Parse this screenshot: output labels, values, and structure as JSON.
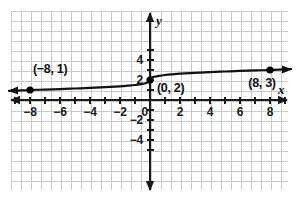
{
  "chart_data": {
    "type": "line",
    "title": "",
    "xlabel": "x",
    "ylabel": "y",
    "grid": true,
    "legend": false,
    "xlim": [
      -9.5,
      9.5
    ],
    "ylim": [
      -5.8,
      5.5
    ],
    "xticks": [
      -8,
      -6,
      -4,
      -2,
      0,
      2,
      4,
      6,
      8
    ],
    "yticks": [
      4,
      2,
      -2,
      -4
    ],
    "xtick_labels": [
      "−8",
      "−6",
      "−4",
      "−2",
      "0",
      "2",
      "4",
      "6",
      "8"
    ],
    "ytick_labels": [
      "4",
      "2",
      "−2",
      "−4"
    ],
    "minor_tick_step": 1,
    "curve_description": "cube root function shifted up 2 units",
    "series": [
      {
        "name": "curve",
        "arrow_start": true,
        "arrow_end": true,
        "points": [
          {
            "x": -9.4,
            "y": 0.92
          },
          {
            "x": -9.0,
            "y": 0.93
          },
          {
            "x": -8.0,
            "y": 1.0
          },
          {
            "x": -7.0,
            "y": 1.04
          },
          {
            "x": -6.0,
            "y": 1.09
          },
          {
            "x": -5.0,
            "y": 1.15
          },
          {
            "x": -4.0,
            "y": 1.21
          },
          {
            "x": -3.0,
            "y": 1.29
          },
          {
            "x": -2.0,
            "y": 1.37
          },
          {
            "x": -1.5,
            "y": 1.43
          },
          {
            "x": -1.0,
            "y": 1.5
          },
          {
            "x": -0.6,
            "y": 1.58
          },
          {
            "x": -0.3,
            "y": 1.67
          },
          {
            "x": -0.1,
            "y": 1.78
          },
          {
            "x": 0.0,
            "y": 2.0
          },
          {
            "x": 0.1,
            "y": 2.22
          },
          {
            "x": 0.3,
            "y": 2.33
          },
          {
            "x": 0.6,
            "y": 2.42
          },
          {
            "x": 1.0,
            "y": 2.5
          },
          {
            "x": 1.5,
            "y": 2.57
          },
          {
            "x": 2.0,
            "y": 2.63
          },
          {
            "x": 3.0,
            "y": 2.71
          },
          {
            "x": 4.0,
            "y": 2.79
          },
          {
            "x": 5.0,
            "y": 2.85
          },
          {
            "x": 6.0,
            "y": 2.91
          },
          {
            "x": 7.0,
            "y": 2.96
          },
          {
            "x": 8.0,
            "y": 3.0
          },
          {
            "x": 9.0,
            "y": 3.07
          },
          {
            "x": 9.4,
            "y": 3.08
          }
        ]
      }
    ],
    "plotted_points": [
      {
        "x": -8,
        "y": 1,
        "label": "(−8, 1)",
        "label_position": "above-right"
      },
      {
        "x": 0,
        "y": 2,
        "label": "(0, 2)",
        "label_position": "right-below"
      },
      {
        "x": 8,
        "y": 3,
        "label": "(8, 3)",
        "label_position": "below-left"
      }
    ],
    "colors": {
      "curve": "#111111",
      "axis": "#1a1a1a",
      "grid": "#c9c9c9",
      "background": "#ffffff",
      "point": "#000000",
      "text": "#111111"
    }
  }
}
